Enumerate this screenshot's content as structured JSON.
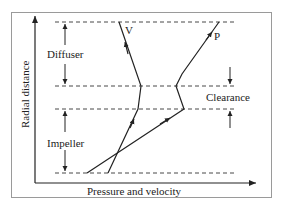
{
  "diagram": {
    "axes": {
      "y_label": "Radial distance",
      "x_label": "Pressure and velocity"
    },
    "regions": {
      "diffuser": "Diffuser",
      "impeller": "Impeller",
      "clearance": "Clearance"
    },
    "curves": {
      "velocity": "V",
      "pressure": "P"
    },
    "colors": {
      "line": "#222222",
      "frame": "#9a9a9a",
      "background": "#ffffff"
    }
  }
}
